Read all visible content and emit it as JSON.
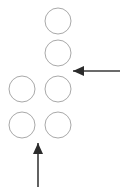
{
  "canvas": {
    "width": 122,
    "height": 187,
    "background_color": "#ffffff"
  },
  "diagram": {
    "title": "",
    "shape_style": {
      "circle_stroke_color": "#a9a9a9",
      "circle_fill": "none",
      "circle_stroke_width": 1,
      "circle_radius": 13,
      "arrow_color": "#2b2b2b"
    },
    "circles": [
      {
        "name": "circle-top-right",
        "cx": 58,
        "cy": 21,
        "r": 13
      },
      {
        "name": "circle-upper-right",
        "cx": 58,
        "cy": 53,
        "r": 13
      },
      {
        "name": "circle-middle-left",
        "cx": 22,
        "cy": 89,
        "r": 13
      },
      {
        "name": "circle-middle-right",
        "cx": 58,
        "cy": 89,
        "r": 13
      },
      {
        "name": "circle-bottom-left",
        "cx": 22,
        "cy": 125,
        "r": 13
      },
      {
        "name": "circle-bottom-right",
        "cx": 58,
        "cy": 125,
        "r": 13
      }
    ],
    "arrows": [
      {
        "name": "horizontal-arrow-left",
        "direction": "left",
        "tail_x": 120,
        "tail_y": 71,
        "tip_x": 73,
        "tip_y": 71,
        "head_points": "73,71 84,66 84,76"
      },
      {
        "name": "vertical-arrow-up",
        "direction": "up",
        "tail_x": 38,
        "tail_y": 187,
        "tip_x": 38,
        "tip_y": 143,
        "head_points": "38,143 33,154 43,154"
      }
    ]
  }
}
